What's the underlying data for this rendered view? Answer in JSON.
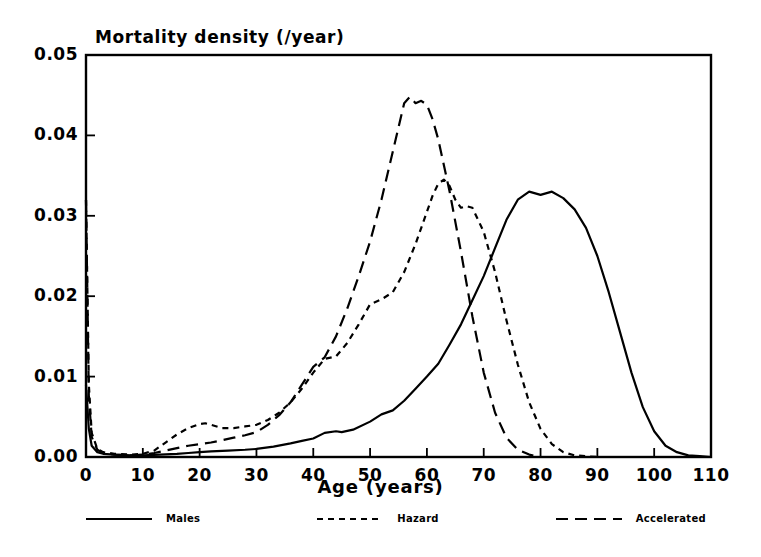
{
  "chart_data": {
    "type": "line",
    "title": "",
    "xlabel": "Age (years)",
    "ylabel": "Mortality density (/year)",
    "xlim": [
      0,
      110
    ],
    "ylim": [
      0.0,
      0.05
    ],
    "grid": false,
    "legend_position": "bottom",
    "xticks": [
      "0",
      "10",
      "20",
      "30",
      "40",
      "50",
      "60",
      "70",
      "80",
      "90",
      "100",
      "110"
    ],
    "xtick_values": [
      0,
      10,
      20,
      30,
      40,
      50,
      60,
      70,
      80,
      90,
      100,
      110
    ],
    "yticks": [
      "0.00",
      "0.01",
      "0.02",
      "0.03",
      "0.04",
      "0.05"
    ],
    "ytick_values": [
      0.0,
      0.01,
      0.02,
      0.03,
      0.04,
      0.05
    ],
    "series": [
      {
        "name": "Males",
        "style": "solid",
        "color": "#000000",
        "x": [
          0,
          0.5,
          1,
          2,
          3,
          5,
          8,
          10,
          13,
          16,
          18,
          20,
          22,
          25,
          28,
          30,
          33,
          36,
          38,
          40,
          42,
          44,
          45,
          47,
          50,
          52,
          54,
          56,
          58,
          60,
          62,
          64,
          66,
          68,
          70,
          72,
          74,
          76,
          78,
          80,
          82,
          84,
          86,
          88,
          90,
          92,
          94,
          96,
          98,
          100,
          102,
          104,
          106,
          108,
          110
        ],
        "y": [
          0.009,
          0.0035,
          0.0014,
          0.0006,
          0.0004,
          0.0003,
          0.0002,
          0.0002,
          0.0003,
          0.0004,
          0.0005,
          0.0006,
          0.0007,
          0.0008,
          0.0009,
          0.001,
          0.0013,
          0.0017,
          0.002,
          0.0023,
          0.003,
          0.0032,
          0.0031,
          0.0034,
          0.0044,
          0.0053,
          0.0058,
          0.007,
          0.0085,
          0.01,
          0.0116,
          0.014,
          0.0165,
          0.0195,
          0.0225,
          0.026,
          0.0295,
          0.032,
          0.033,
          0.0326,
          0.033,
          0.0322,
          0.0308,
          0.0285,
          0.025,
          0.0205,
          0.0155,
          0.0105,
          0.0062,
          0.0032,
          0.0014,
          0.0006,
          0.0002,
          0.0001,
          0.0
        ]
      },
      {
        "name": "Hazard",
        "style": "short-dashed",
        "color": "#000000",
        "x": [
          0,
          0.5,
          1,
          2,
          3,
          5,
          8,
          10,
          12,
          14,
          16,
          18,
          20,
          21,
          22,
          24,
          26,
          28,
          30,
          32,
          34,
          36,
          38,
          40,
          42,
          44,
          46,
          48,
          50,
          52,
          54,
          56,
          58,
          60,
          61,
          62,
          63,
          64,
          65,
          66,
          67,
          68,
          70,
          72,
          74,
          76,
          78,
          80,
          82,
          84,
          86,
          88,
          90
        ],
        "y": [
          0.032,
          0.009,
          0.003,
          0.001,
          0.0006,
          0.0004,
          0.0003,
          0.0004,
          0.0008,
          0.0018,
          0.0028,
          0.0036,
          0.0041,
          0.0042,
          0.004,
          0.0036,
          0.0036,
          0.0038,
          0.004,
          0.0046,
          0.0055,
          0.0068,
          0.0085,
          0.0105,
          0.0122,
          0.0125,
          0.0142,
          0.0165,
          0.019,
          0.0196,
          0.0205,
          0.023,
          0.0265,
          0.0305,
          0.0325,
          0.034,
          0.0345,
          0.0337,
          0.032,
          0.031,
          0.0312,
          0.031,
          0.028,
          0.023,
          0.017,
          0.0115,
          0.0068,
          0.0035,
          0.0016,
          0.0006,
          0.0002,
          0.0001,
          0.0
        ]
      },
      {
        "name": "Accelerated",
        "style": "long-dashed",
        "color": "#000000",
        "x": [
          0,
          0.5,
          1,
          2,
          3,
          5,
          8,
          10,
          12,
          14,
          16,
          18,
          20,
          22,
          24,
          26,
          28,
          30,
          32,
          34,
          36,
          38,
          40,
          42,
          44,
          46,
          48,
          50,
          52,
          54,
          56,
          57,
          58,
          59,
          60,
          61,
          62,
          64,
          66,
          68,
          70,
          72,
          74,
          76,
          78,
          80
        ],
        "y": [
          0.032,
          0.0075,
          0.0025,
          0.0009,
          0.0005,
          0.0003,
          0.0002,
          0.0003,
          0.0005,
          0.0008,
          0.0011,
          0.0014,
          0.0016,
          0.0018,
          0.0021,
          0.0024,
          0.0027,
          0.0031,
          0.004,
          0.0052,
          0.0068,
          0.009,
          0.0112,
          0.0124,
          0.015,
          0.0185,
          0.0225,
          0.0268,
          0.032,
          0.038,
          0.044,
          0.0448,
          0.044,
          0.0443,
          0.0438,
          0.042,
          0.0395,
          0.033,
          0.0255,
          0.0175,
          0.0105,
          0.0055,
          0.0024,
          0.0009,
          0.0003,
          0.0
        ]
      }
    ],
    "annotations": []
  },
  "legend": {
    "entries": [
      {
        "label": "Males",
        "style": "solid"
      },
      {
        "label": "Hazard",
        "style": "short-dashed"
      },
      {
        "label": "Accelerated",
        "style": "long-dashed"
      }
    ]
  }
}
